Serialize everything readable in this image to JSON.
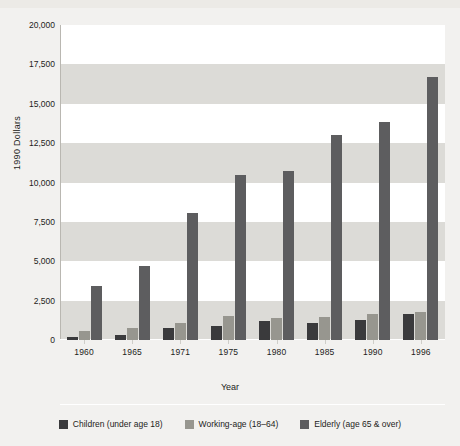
{
  "chart_data": {
    "type": "bar",
    "title": "",
    "xlabel": "Year",
    "ylabel": "1990 Dollars",
    "categories": [
      "1960",
      "1965",
      "1971",
      "1975",
      "1980",
      "1985",
      "1990",
      "1996"
    ],
    "ylim": [
      0,
      20000
    ],
    "yticks": [
      0,
      2500,
      5000,
      7500,
      10000,
      12500,
      15000,
      17500,
      20000
    ],
    "ytick_labels": [
      "0",
      "2,500",
      "5,000",
      "7,500",
      "10,000",
      "12,500",
      "15,000",
      "17,500",
      "20,000"
    ],
    "grid": "horizontal alternating bands",
    "legend_position": "bottom",
    "series": [
      {
        "name": "Children (under age 18)",
        "color": "#3a3a3c",
        "values": [
          200,
          300,
          750,
          900,
          1200,
          1050,
          1300,
          1650
        ]
      },
      {
        "name": "Working-age (18–64)",
        "color": "#97968f",
        "values": [
          600,
          750,
          1050,
          1500,
          1400,
          1450,
          1650,
          1800
        ]
      },
      {
        "name": "Elderly (age 65 & over)",
        "color": "#5d5d5f",
        "values": [
          3450,
          4700,
          8060,
          10450,
          10700,
          13000,
          13850,
          16700
        ]
      }
    ]
  },
  "axis": {
    "y_title": "1990 Dollars",
    "x_title": "Year"
  },
  "legend": {
    "items": [
      {
        "label": "Children (under age 18)",
        "color": "#3a3a3c",
        "swatch": "children"
      },
      {
        "label": "Working-age (18–64)",
        "color": "#97968f",
        "swatch": "working"
      },
      {
        "label": "Elderly (age 65 & over)",
        "color": "#5d5d5f",
        "swatch": "elderly"
      }
    ]
  },
  "colors": {
    "page_background": "#f2f1ef",
    "band_light": "#ffffff",
    "band_grey": "#dcdbd7",
    "children": "#3a3a3c",
    "working": "#97968f",
    "elderly": "#5d5d5f",
    "text": "#1d1d1b"
  }
}
